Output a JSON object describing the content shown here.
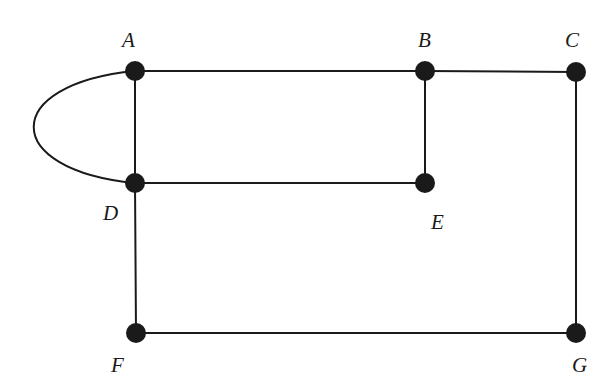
{
  "diagram": {
    "type": "undirected-graph",
    "style": {
      "line_color": "#1a1a1a",
      "node_color": "#1a1a1a",
      "background": "#ffffff",
      "node_radius": 10
    },
    "nodes": [
      {
        "id": "A",
        "label": "A",
        "x": 135,
        "y": 71,
        "label_x": 122,
        "label_y": 47
      },
      {
        "id": "B",
        "label": "B",
        "x": 425,
        "y": 71,
        "label_x": 418,
        "label_y": 47
      },
      {
        "id": "C",
        "label": "C",
        "x": 576,
        "y": 72,
        "label_x": 565,
        "label_y": 47
      },
      {
        "id": "D",
        "label": "D",
        "x": 135,
        "y": 183,
        "label_x": 103,
        "label_y": 220
      },
      {
        "id": "E",
        "label": "E",
        "x": 425,
        "y": 183,
        "label_x": 431,
        "label_y": 229
      },
      {
        "id": "F",
        "label": "F",
        "x": 136,
        "y": 333,
        "label_x": 111,
        "label_y": 372
      },
      {
        "id": "G",
        "label": "G",
        "x": 576,
        "y": 333,
        "label_x": 572,
        "label_y": 372
      }
    ],
    "edges": [
      {
        "from": "A",
        "to": "B",
        "shape": "straight"
      },
      {
        "from": "B",
        "to": "C",
        "shape": "straight"
      },
      {
        "from": "A",
        "to": "D",
        "shape": "straight"
      },
      {
        "from": "A",
        "to": "D",
        "shape": "curved-left-loop"
      },
      {
        "from": "B",
        "to": "E",
        "shape": "straight"
      },
      {
        "from": "D",
        "to": "E",
        "shape": "straight"
      },
      {
        "from": "D",
        "to": "F",
        "shape": "straight"
      },
      {
        "from": "C",
        "to": "G",
        "shape": "straight"
      },
      {
        "from": "F",
        "to": "G",
        "shape": "straight"
      }
    ]
  }
}
